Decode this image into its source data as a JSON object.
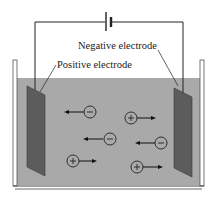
{
  "diagram": {
    "labels": {
      "negative_electrode": "Negative electrode",
      "positive_electrode": "Positive electrode"
    },
    "colors": {
      "solution": "#a9a9a9",
      "electrode": "#5c5c5c",
      "wire": "#222222",
      "container": "#444444"
    },
    "ions": [
      {
        "charge": "−",
        "direction": "left"
      },
      {
        "charge": "+",
        "direction": "right"
      },
      {
        "charge": "−",
        "direction": "left"
      },
      {
        "charge": "−",
        "direction": "left"
      },
      {
        "charge": "+",
        "direction": "right"
      },
      {
        "charge": "+",
        "direction": "right"
      }
    ]
  }
}
